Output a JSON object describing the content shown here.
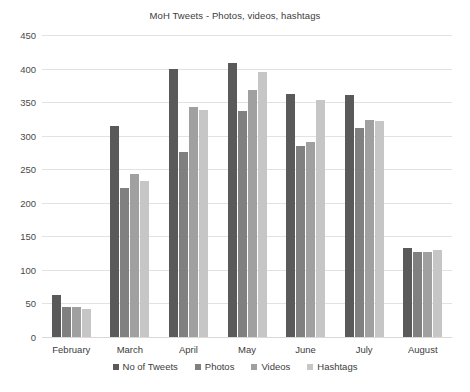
{
  "chart_data": {
    "type": "bar",
    "title": "MoH Tweets - Photos, videos, hashtags",
    "xlabel": "",
    "ylabel": "",
    "ylim": [
      0,
      450
    ],
    "ytick_step": 50,
    "yticks": [
      0,
      50,
      100,
      150,
      200,
      250,
      300,
      350,
      400,
      450
    ],
    "grid": true,
    "legend_position": "bottom",
    "categories": [
      "February",
      "March",
      "April",
      "May",
      "June",
      "July",
      "August"
    ],
    "series": [
      {
        "name": "No of Tweets",
        "color": "#5a5a5a",
        "values": [
          62,
          315,
          400,
          408,
          362,
          360,
          132
        ]
      },
      {
        "name": "Photos",
        "color": "#808080",
        "values": [
          45,
          222,
          275,
          337,
          285,
          312,
          126
        ]
      },
      {
        "name": "Videos",
        "color": "#a0a0a0",
        "values": [
          44,
          243,
          342,
          368,
          291,
          324,
          126
        ]
      },
      {
        "name": "Hashtags",
        "color": "#c6c6c6",
        "values": [
          42,
          233,
          338,
          395,
          353,
          322,
          130
        ]
      }
    ]
  }
}
